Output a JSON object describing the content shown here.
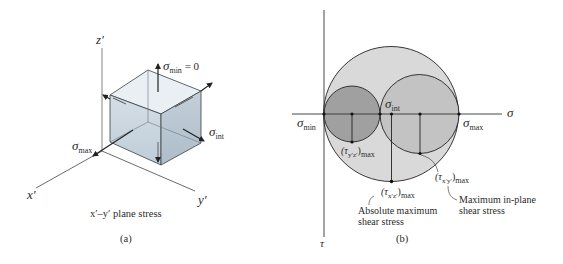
{
  "panel_a": {
    "axes": {
      "z": "z′",
      "x": "x′",
      "y": "y′"
    },
    "labels": {
      "sigma_min": {
        "symbol": "σ",
        "sub": "min",
        "suffix": " = 0"
      },
      "sigma_int": {
        "symbol": "σ",
        "sub": "int"
      },
      "sigma_max": {
        "symbol": "σ",
        "sub": "max"
      }
    },
    "caption": "x′–y′ plane stress",
    "tag": "(a)",
    "colors": {
      "top_face": "#e9eff3",
      "front_face": "#c9d5df",
      "side_face": "#b7c5d1",
      "edge": "#3a3f44"
    }
  },
  "panel_b": {
    "axes": {
      "horizontal": "σ",
      "vertical": "τ"
    },
    "labels": {
      "sigma_min": {
        "symbol": "σ",
        "sub": "min"
      },
      "sigma_int": {
        "symbol": "σ",
        "sub": "int"
      },
      "sigma_max": {
        "symbol": "σ",
        "sub": "max"
      },
      "tau_yz": {
        "text": "(τ",
        "sub1": "y′z′",
        "close": ")",
        "sub2": "max"
      },
      "tau_xz": {
        "text": "(τ",
        "sub1": "x′z′",
        "close": ")",
        "sub2": "max"
      },
      "tau_xy": {
        "text": "(τ",
        "sub1": "x′y′",
        "close": ")",
        "sub2": "max"
      }
    },
    "annotations": {
      "absolute": [
        "Absolute maximum",
        "shear stress"
      ],
      "in_plane": [
        "Maximum in-plane",
        "shear stress"
      ]
    },
    "tag": "(b)",
    "circles": [
      {
        "name": "large",
        "cx": 391,
        "cy": 114,
        "r": 67.5,
        "fill": "#d9d9d9"
      },
      {
        "name": "medium",
        "cx": 419.5,
        "cy": 114,
        "r": 39.5,
        "fill": "#c3c3c3"
      },
      {
        "name": "small",
        "cx": 352,
        "cy": 114,
        "r": 28,
        "fill": "#a0a0a0"
      }
    ]
  }
}
